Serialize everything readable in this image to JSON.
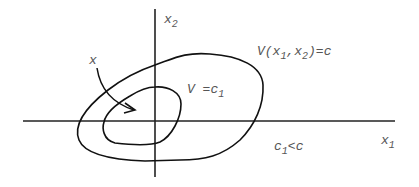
{
  "diagram": {
    "type": "level-sets",
    "axes": {
      "x_label": "x",
      "x_label_sub": "1",
      "y_label": "x",
      "y_label_sub": "2"
    },
    "labels": {
      "state": "x",
      "outer_curve": {
        "prefix": "V(x",
        "sub1": "1",
        "mid": ",x",
        "sub2": "2",
        "suffix": ")=c"
      },
      "inner_curve": {
        "prefix": "V =c",
        "sub": "1"
      },
      "inequality": {
        "prefix": "c",
        "sub": "1",
        "suffix": "<c"
      }
    },
    "colors": {
      "stroke": "#111111",
      "text": "#555555",
      "background": "#ffffff"
    }
  }
}
